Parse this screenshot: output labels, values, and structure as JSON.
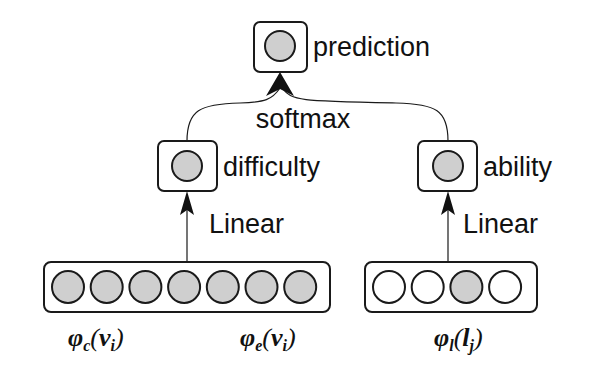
{
  "diagram": {
    "nodes": {
      "prediction": {
        "label": "prediction",
        "filled": true
      },
      "difficulty": {
        "label": "difficulty",
        "filled": true
      },
      "ability": {
        "label": "ability",
        "filled": true
      }
    },
    "edges": {
      "softmax": {
        "label": "softmax"
      },
      "linear_left": {
        "label": "Linear"
      },
      "linear_right": {
        "label": "Linear"
      }
    },
    "input_vectors": {
      "left": {
        "units": [
          true,
          true,
          true,
          true,
          true,
          true,
          true
        ],
        "labels": [
          {
            "base": "φ",
            "sub": "c",
            "arg": "v",
            "arg_sub": "i"
          },
          {
            "base": "φ",
            "sub": "e",
            "arg": "v",
            "arg_sub": "i"
          }
        ]
      },
      "right": {
        "units": [
          false,
          false,
          true,
          false
        ],
        "labels": [
          {
            "base": "φ",
            "sub": "l",
            "arg": "l",
            "arg_sub": "j"
          }
        ]
      }
    },
    "colors": {
      "stroke": "#1a1a1a",
      "filled_unit": "#cfcfcf",
      "empty_unit": "#ffffff",
      "background": "#ffffff"
    }
  }
}
